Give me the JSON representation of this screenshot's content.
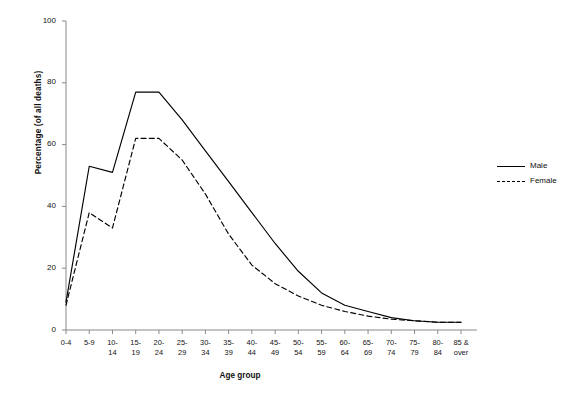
{
  "chart_data": {
    "type": "line",
    "title": "",
    "xlabel": "Age group",
    "ylabel": "Percentage (of all deaths)",
    "ylim": [
      0,
      100
    ],
    "yticks": [
      0,
      20,
      40,
      60,
      80,
      100
    ],
    "grid": false,
    "legend_position": "right",
    "categories": [
      "0-4",
      "5-9",
      "10-\n14",
      "15-\n19",
      "20-\n24",
      "25-\n29",
      "30-\n34",
      "35-\n39",
      "40-\n44",
      "45-\n49",
      "50-\n54",
      "55-\n59",
      "60-\n64",
      "65-\n69",
      "70-\n74",
      "75-\n79",
      "80-\n84",
      "85 &\nover"
    ],
    "categories_flat": [
      "0-4",
      "5-9",
      "10-14",
      "15-19",
      "20-24",
      "25-29",
      "30-34",
      "35-39",
      "40-44",
      "45-49",
      "50-54",
      "55-59",
      "60-64",
      "65-69",
      "70-74",
      "75-79",
      "80-84",
      "85 & over"
    ],
    "series": [
      {
        "name": "Male",
        "style": "solid",
        "color": "#000000",
        "values": [
          9,
          53,
          51,
          77,
          77,
          68,
          58,
          48,
          38,
          28,
          19,
          12,
          8,
          6,
          4,
          3,
          2.5,
          2.5
        ]
      },
      {
        "name": "Female",
        "style": "dashed",
        "color": "#000000",
        "values": [
          8,
          38,
          33,
          62,
          62,
          55,
          44,
          31,
          21,
          15,
          11,
          8,
          6,
          4.5,
          3.5,
          3,
          2.5,
          2.5
        ]
      }
    ]
  },
  "legend": {
    "items": [
      {
        "label": "Male",
        "style": "solid"
      },
      {
        "label": "Female",
        "style": "dashed"
      }
    ]
  }
}
